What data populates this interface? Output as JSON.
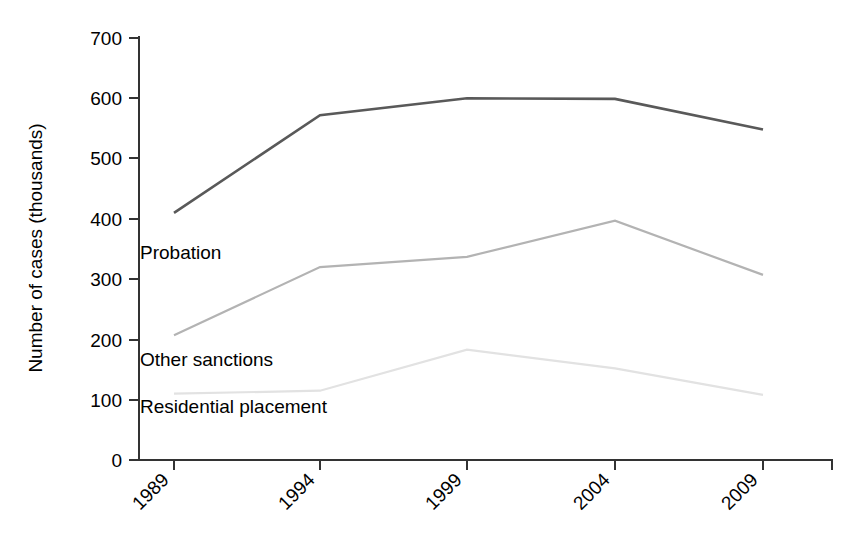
{
  "chart_data": {
    "type": "line",
    "title": "",
    "xlabel": "",
    "ylabel": "Number of cases (thousands)",
    "categories": [
      "1989",
      "1994",
      "1999",
      "2004",
      "2009"
    ],
    "x": [
      1989,
      1994,
      1999,
      2004,
      2009
    ],
    "ylim": [
      0,
      700
    ],
    "xlim": [
      1989,
      2009
    ],
    "yticks": [
      "0",
      "100",
      "200",
      "300",
      "400",
      "500",
      "600",
      "700"
    ],
    "ytick_values": [
      0,
      100,
      200,
      300,
      400,
      500,
      600,
      700
    ],
    "grid": false,
    "legend_position": "inline-labels",
    "series": [
      {
        "name": "Probation",
        "color": "#595959",
        "values": [
          410,
          572,
          600,
          599,
          548
        ]
      },
      {
        "name": "Other sanctions",
        "color": "#b3b3b3",
        "values": [
          207,
          320,
          337,
          397,
          307
        ]
      },
      {
        "name": "Residential placement",
        "color": "#e2e2e2",
        "values": [
          110,
          115,
          183,
          152,
          108
        ]
      }
    ],
    "annotations": [
      {
        "text": "Probation",
        "x_px": 140,
        "y_px": 259
      },
      {
        "text": "Other sanctions",
        "x_px": 140,
        "y_px": 366
      },
      {
        "text": "Residential placement",
        "x_px": 140,
        "y_px": 413
      }
    ]
  },
  "axis": {
    "y_label": "Number of cases (thousands)"
  }
}
